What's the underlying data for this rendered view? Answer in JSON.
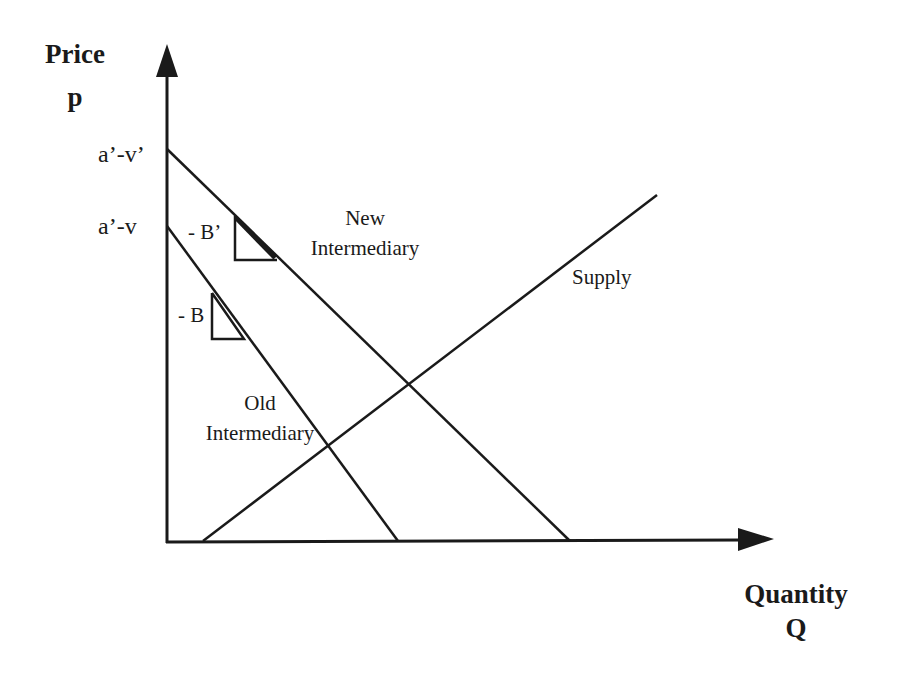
{
  "axes": {
    "y_title": "Price",
    "y_symbol": "p",
    "x_title": "Quantity",
    "x_symbol": "Q",
    "y_ticks": [
      {
        "label": "a’-v’",
        "y": 149
      },
      {
        "label": "a’-v",
        "y": 226
      }
    ]
  },
  "curves": {
    "new_demand": {
      "line1": "New",
      "line2": "Intermediary",
      "slope_label": "- B’"
    },
    "old_demand": {
      "line1": "Old",
      "line2": "Intermediary",
      "slope_label": "- B"
    },
    "supply": {
      "label": "Supply"
    }
  },
  "colors": {
    "ink": "#1a1a1a",
    "background": "#ffffff"
  },
  "geometry": {
    "origin": [
      167,
      542
    ],
    "y_axis_top": 45,
    "x_axis_right": 773,
    "new_demand": [
      [
        167,
        149
      ],
      [
        570,
        541
      ]
    ],
    "old_demand": [
      [
        167,
        226
      ],
      [
        398,
        541
      ]
    ],
    "supply": [
      [
        203,
        541
      ],
      [
        657,
        195
      ]
    ]
  }
}
